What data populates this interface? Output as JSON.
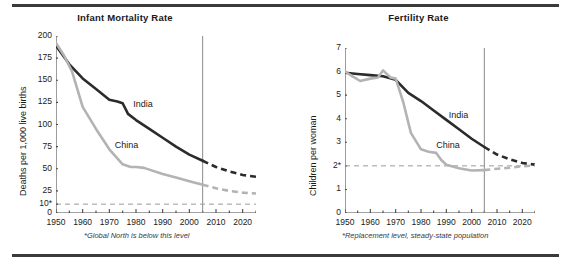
{
  "figure": {
    "panels": [
      "infant-mortality",
      "fertility"
    ]
  },
  "chart_data": [
    {
      "id": "infant-mortality",
      "type": "line",
      "title": "Infant Mortality Rate",
      "xlabel": "",
      "ylabel": "Deaths per 1,000 live births",
      "xlim": [
        1950,
        2025
      ],
      "ylim": [
        0,
        200
      ],
      "grid": false,
      "legend": "inline-labels",
      "yticks": [
        0,
        25,
        50,
        75,
        100,
        125,
        150,
        175,
        200
      ],
      "ytick_labels": [
        "0",
        "25",
        "50",
        "75",
        "100",
        "125",
        "150",
        "175",
        "200"
      ],
      "extra_ytick": {
        "value": 10,
        "label": "10*"
      },
      "xticks": [
        1950,
        1960,
        1970,
        1980,
        1990,
        2000,
        2010,
        2020
      ],
      "xtick_labels": [
        "1950",
        "1960",
        "1970",
        "1980",
        "1990",
        "2000",
        "2010",
        "2020"
      ],
      "xminor_step": 5,
      "projection_start": 2005,
      "reference_line": {
        "value": 10,
        "label": "10*",
        "style": "dashed"
      },
      "footnote": "*Global North is below this level",
      "series": [
        {
          "name": "India",
          "color": "#2b2b2b",
          "label_x": 1979,
          "label_y": 122,
          "x": [
            1950,
            1955,
            1960,
            1965,
            1970,
            1973,
            1975,
            1977,
            1980,
            1985,
            1990,
            1995,
            2000,
            2005
          ],
          "values": [
            189,
            168,
            152,
            140,
            128,
            126,
            124,
            112,
            105,
            95,
            85,
            75,
            66,
            59
          ],
          "projected_x": [
            2005,
            2010,
            2015,
            2020,
            2025
          ],
          "projected_values": [
            59,
            52,
            47,
            43,
            41
          ]
        },
        {
          "name": "China",
          "color": "#b3b3b3",
          "label_x": 1972,
          "label_y": 76,
          "x": [
            1950,
            1953,
            1956,
            1960,
            1965,
            1970,
            1975,
            1978,
            1980,
            1983,
            1985,
            1990,
            1995,
            2000,
            2005
          ],
          "values": [
            192,
            178,
            160,
            120,
            95,
            72,
            55,
            52,
            52,
            51,
            49,
            44,
            40,
            36,
            32
          ],
          "projected_x": [
            2005,
            2010,
            2015,
            2020,
            2025
          ],
          "projected_values": [
            32,
            28,
            25,
            23,
            22
          ]
        }
      ]
    },
    {
      "id": "fertility",
      "type": "line",
      "title": "Fertility Rate",
      "xlabel": "",
      "ylabel": "Children per woman",
      "xlim": [
        1950,
        2025
      ],
      "ylim": [
        0,
        7
      ],
      "grid": false,
      "legend": "inline-labels",
      "yticks": [
        0,
        1,
        2,
        3,
        4,
        5,
        6,
        7
      ],
      "ytick_labels": [
        "0",
        "1",
        "2*",
        "3",
        "4",
        "5",
        "6",
        "7"
      ],
      "xticks": [
        1950,
        1960,
        1970,
        1980,
        1990,
        2000,
        2010,
        2020
      ],
      "xtick_labels": [
        "1950",
        "1960",
        "1970",
        "1980",
        "1990",
        "2000",
        "2010",
        "2020"
      ],
      "xminor_step": 5,
      "projection_start": 2005,
      "reference_line": {
        "value": 2,
        "label": "2*",
        "style": "dashed"
      },
      "footnote": "*Replacement level, steady-state population",
      "series": [
        {
          "name": "India",
          "color": "#2b2b2b",
          "label_x": 1991,
          "label_y": 4.1,
          "x": [
            1950,
            1955,
            1960,
            1965,
            1970,
            1975,
            1980,
            1985,
            1990,
            1995,
            2000,
            2005
          ],
          "values": [
            5.95,
            5.9,
            5.85,
            5.8,
            5.65,
            5.1,
            4.75,
            4.35,
            3.95,
            3.55,
            3.15,
            2.8
          ],
          "projected_x": [
            2005,
            2010,
            2015,
            2020,
            2025
          ],
          "projected_values": [
            2.8,
            2.48,
            2.28,
            2.12,
            2.05
          ]
        },
        {
          "name": "China",
          "color": "#b3b3b3",
          "label_x": 1986,
          "label_y": 2.85,
          "x": [
            1950,
            1953,
            1956,
            1960,
            1963,
            1965,
            1968,
            1970,
            1973,
            1976,
            1980,
            1983,
            1986,
            1988,
            1990,
            1995,
            2000,
            2005
          ],
          "values": [
            6.0,
            5.8,
            5.6,
            5.7,
            5.75,
            6.05,
            5.75,
            5.7,
            4.7,
            3.4,
            2.7,
            2.6,
            2.55,
            2.25,
            2.05,
            1.9,
            1.8,
            1.82
          ],
          "projected_x": [
            2005,
            2010,
            2015,
            2020,
            2025
          ],
          "projected_values": [
            1.82,
            1.88,
            1.92,
            1.98,
            2.02
          ]
        }
      ]
    }
  ]
}
